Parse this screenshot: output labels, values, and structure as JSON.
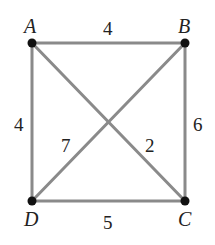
{
  "graph": {
    "vertices": [
      {
        "id": "A",
        "label": "A",
        "x": 32,
        "y": 43,
        "lx": 24,
        "ly": 33
      },
      {
        "id": "B",
        "label": "B",
        "x": 185,
        "y": 43,
        "lx": 178,
        "ly": 33
      },
      {
        "id": "C",
        "label": "C",
        "x": 185,
        "y": 201,
        "lx": 178,
        "ly": 226
      },
      {
        "id": "D",
        "label": "D",
        "x": 32,
        "y": 201,
        "lx": 24,
        "ly": 226
      }
    ],
    "edges": [
      {
        "from": "A",
        "to": "B",
        "weight": "4",
        "lx": 108,
        "ly": 36
      },
      {
        "from": "A",
        "to": "D",
        "weight": "4",
        "lx": 20,
        "ly": 133
      },
      {
        "from": "B",
        "to": "C",
        "weight": "6",
        "lx": 196,
        "ly": 133
      },
      {
        "from": "D",
        "to": "C",
        "weight": "5",
        "lx": 108,
        "ly": 228
      },
      {
        "from": "D",
        "to": "B",
        "weight": "7",
        "lx": 66,
        "ly": 154
      },
      {
        "from": "A",
        "to": "C",
        "weight": "2",
        "lx": 150,
        "ly": 154
      }
    ]
  }
}
